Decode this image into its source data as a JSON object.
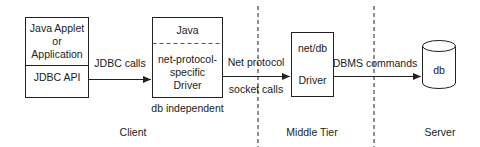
{
  "client_box": {
    "top_lines": [
      "Java Applet",
      "or",
      "Application"
    ],
    "bottom_label": "JDBC API"
  },
  "arrow_jdbc": {
    "label": "JDBC calls"
  },
  "driver_box": {
    "top_label": "Java",
    "bottom_lines": [
      "net-protocol-",
      "specific",
      "Driver"
    ],
    "caption": "db independent"
  },
  "arrow_net": {
    "label_top": "Net protocol",
    "label_bottom": "socket calls"
  },
  "middle_box": {
    "top_label": "net/db",
    "bottom_label": "Driver"
  },
  "arrow_dbms": {
    "label": "DBMS commands"
  },
  "database": {
    "label": "db"
  },
  "tiers": {
    "client": "Client",
    "middle": "Middle Tier",
    "server": "Server"
  },
  "colors": {
    "line": "#222222",
    "background": "#ffffff"
  }
}
